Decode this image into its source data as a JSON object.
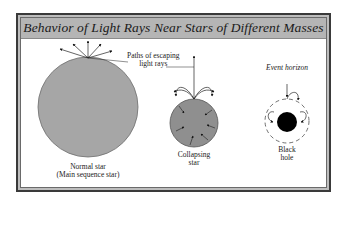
{
  "diagram": {
    "title": "Behavior of Light Rays Near Stars of Different Masses",
    "colors": {
      "title_band": "#b5b5b5",
      "star_fill": "#a6a6a6",
      "black_hole": "#000000",
      "frame": "#3a3a3a"
    },
    "annotations": {
      "escaping_paths_line1": "Paths of escaping",
      "escaping_paths_line2": "light rays",
      "event_horizon": "Event horizon"
    },
    "objects": [
      {
        "id": "normal-star",
        "label_line1": "Normal star",
        "label_line2": "(Main sequence star)"
      },
      {
        "id": "collapsing-star",
        "label_line1": "Collapsing",
        "label_line2": "star"
      },
      {
        "id": "black-hole",
        "label_line1": "Black",
        "label_line2": "hole"
      }
    ]
  }
}
